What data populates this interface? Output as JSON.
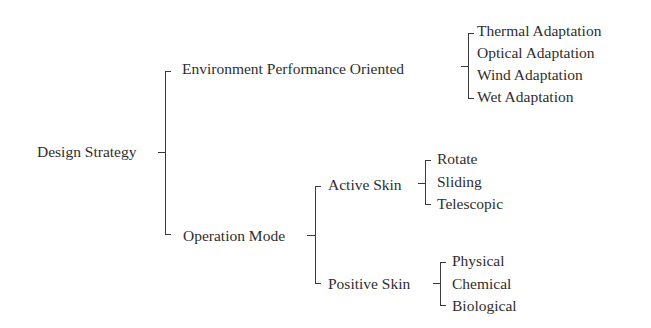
{
  "diagram": {
    "type": "tree",
    "root": {
      "label": "Design Strategy",
      "children": [
        {
          "label": "Environment Performance Oriented",
          "children": [
            {
              "label": "Thermal Adaptation"
            },
            {
              "label": "Optical Adaptation"
            },
            {
              "label": "Wind Adaptation"
            },
            {
              "label": "Wet Adaptation"
            }
          ]
        },
        {
          "label": "Operation Mode",
          "children": [
            {
              "label": "Active Skin",
              "children": [
                {
                  "label": "Rotate"
                },
                {
                  "label": "Sliding"
                },
                {
                  "label": "Telescopic"
                }
              ]
            },
            {
              "label": "Positive Skin",
              "children": [
                {
                  "label": "Physical"
                },
                {
                  "label": "Chemical"
                },
                {
                  "label": "Biological"
                }
              ]
            }
          ]
        }
      ]
    }
  },
  "colors": {
    "text": "#2e2e2e",
    "line": "#3a3a3a",
    "background": "#ffffff"
  }
}
